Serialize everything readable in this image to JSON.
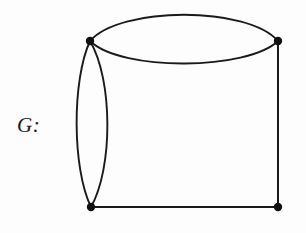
{
  "figure": {
    "label": "G:",
    "background_color": "#fdfdfd",
    "ink_color": "#1a1a1a",
    "width": 306,
    "height": 233
  },
  "chart_data": {
    "type": "diagram",
    "diagram_kind": "multigraph",
    "title": "G:",
    "vertex_count": 4,
    "edge_count": 6,
    "vertices": [
      {
        "id": "top-left",
        "x": 90,
        "y": 41,
        "radius": 4.2
      },
      {
        "id": "top-right",
        "x": 278,
        "y": 41,
        "radius": 4.2
      },
      {
        "id": "bottom-left",
        "x": 91,
        "y": 207,
        "radius": 4.2
      },
      {
        "id": "bottom-right",
        "x": 278,
        "y": 207,
        "radius": 4.2
      }
    ],
    "edges": [
      {
        "id": "top-upper",
        "from": "top-left",
        "to": "top-right",
        "shape": "curve",
        "bow": "up",
        "path": "M 90 41 C 120 6, 248 6, 278 41",
        "stroke_width": 1.9
      },
      {
        "id": "top-lower",
        "from": "top-left",
        "to": "top-right",
        "shape": "curve",
        "bow": "down",
        "path": "M 90 41 C 122 72, 248 70, 278 41",
        "stroke_width": 1.9
      },
      {
        "id": "left-outer",
        "from": "top-left",
        "to": "bottom-left",
        "shape": "curve",
        "bow": "left",
        "path": "M 90 41 C 72 80, 72 168, 91 207",
        "stroke_width": 1.9
      },
      {
        "id": "left-inner",
        "from": "top-left",
        "to": "bottom-left",
        "shape": "curve",
        "bow": "right",
        "path": "M 90 41 C 113 80, 113 168, 91 207",
        "stroke_width": 1.9
      },
      {
        "id": "right-side",
        "from": "top-right",
        "to": "bottom-right",
        "shape": "line",
        "path": "M 278 41 L 278 207",
        "stroke_width": 2.0
      },
      {
        "id": "bottom-side",
        "from": "bottom-left",
        "to": "bottom-right",
        "shape": "line",
        "path": "M 91 207 L 278 207",
        "stroke_width": 2.1
      }
    ],
    "multiplicities": [
      {
        "pair": "top-left--top-right",
        "count": 2
      },
      {
        "pair": "top-left--bottom-left",
        "count": 2
      },
      {
        "pair": "top-right--bottom-right",
        "count": 1
      },
      {
        "pair": "bottom-left--bottom-right",
        "count": 1
      }
    ],
    "degrees": [
      {
        "vertex": "top-left",
        "degree": 4
      },
      {
        "vertex": "top-right",
        "degree": 3
      },
      {
        "vertex": "bottom-left",
        "degree": 3
      },
      {
        "vertex": "bottom-right",
        "degree": 2
      }
    ]
  }
}
